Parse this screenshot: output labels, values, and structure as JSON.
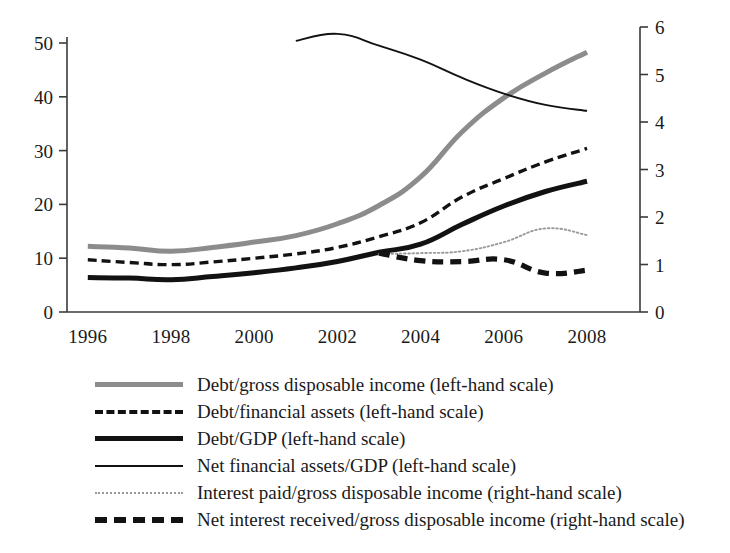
{
  "chart_data": {
    "type": "line",
    "title": "",
    "subtitle": "",
    "xlabel": "",
    "ylabel": "",
    "y2label": "",
    "grid": false,
    "legend_position": "below",
    "x": [
      1996,
      1997,
      1998,
      1999,
      2000,
      2001,
      2002,
      2003,
      2004,
      2005,
      2006,
      2007,
      2008
    ],
    "xlim": [
      1995.5,
      2008.6
    ],
    "xticks": [
      1996,
      1998,
      2000,
      2002,
      2004,
      2006,
      2008
    ],
    "xtick_labels": [
      "1996",
      "1998",
      "2000",
      "2002",
      "2004",
      "2006",
      "2008"
    ],
    "ylim": [
      0,
      53
    ],
    "yticks": [
      0,
      10,
      20,
      30,
      40,
      50
    ],
    "ytick_labels": [
      "0",
      "10",
      "20",
      "30",
      "40",
      "50"
    ],
    "y2lim": [
      0,
      6
    ],
    "y2ticks": [
      0,
      1,
      2,
      3,
      4,
      5,
      6
    ],
    "y2tick_labels": [
      "0",
      "1",
      "2",
      "3",
      "4",
      "5",
      "6"
    ],
    "series": [
      {
        "name": "Debt/gross disposable income (left-hand scale)",
        "axis": "left",
        "style": "thick-grey",
        "color": "#8c8c8c",
        "x": [
          1996,
          1997,
          1998,
          1999,
          2000,
          2001,
          2002,
          2003,
          2004,
          2005,
          2006,
          2007,
          2008
        ],
        "values": [
          12.2,
          11.9,
          11.3,
          12.0,
          13.0,
          14.2,
          16.4,
          19.8,
          25.1,
          33.5,
          39.8,
          44.4,
          48.3
        ]
      },
      {
        "name": "Debt/financial assets (left-hand scale)",
        "axis": "left",
        "style": "dash-medium",
        "color": "#121212",
        "x": [
          1996,
          1997,
          1998,
          1999,
          2000,
          2001,
          2002,
          2003,
          2004,
          2005,
          2006,
          2007,
          2008
        ],
        "values": [
          9.7,
          9.2,
          8.8,
          9.3,
          10.0,
          10.8,
          12.0,
          14.0,
          16.6,
          21.4,
          24.8,
          27.9,
          30.4
        ]
      },
      {
        "name": "Debt/GDP (left-hand scale)",
        "axis": "left",
        "style": "thick-black",
        "color": "#121212",
        "x": [
          1996,
          1997,
          1998,
          1999,
          2000,
          2001,
          2002,
          2003,
          2004,
          2005,
          2006,
          2007,
          2008
        ],
        "values": [
          6.4,
          6.3,
          6.0,
          6.6,
          7.3,
          8.2,
          9.4,
          11.1,
          12.6,
          16.3,
          19.7,
          22.4,
          24.3
        ]
      },
      {
        "name": "Net financial assets/GDP (left-hand scale)",
        "axis": "left",
        "style": "thin-black",
        "color": "#121212",
        "x": [
          2001,
          2002,
          2003,
          2004,
          2005,
          2006,
          2007,
          2008
        ],
        "values": [
          50.4,
          51.7,
          49.5,
          46.9,
          43.5,
          40.6,
          38.5,
          37.4
        ]
      },
      {
        "name": "Interest paid/gross disposable income (right-hand scale)",
        "axis": "right",
        "style": "dotted",
        "color": "#9a9a9a",
        "x": [
          2003,
          2004,
          2005,
          2006,
          2007,
          2008
        ],
        "values": [
          1.22,
          1.24,
          1.28,
          1.47,
          1.76,
          1.62
        ]
      },
      {
        "name": "Net interest received/gross disposable income (right-hand scale)",
        "axis": "right",
        "style": "dash-heavy",
        "color": "#121212",
        "x": [
          2003,
          2004,
          2005,
          2006,
          2007,
          2008
        ],
        "values": [
          1.24,
          1.08,
          1.06,
          1.1,
          0.82,
          0.88
        ]
      }
    ]
  },
  "axes": {
    "left_ticks": [
      "0",
      "10",
      "20",
      "30",
      "40",
      "50"
    ],
    "right_ticks": [
      "0",
      "1",
      "2",
      "3",
      "4",
      "5",
      "6"
    ],
    "x_ticks": [
      "1996",
      "1998",
      "2000",
      "2002",
      "2004",
      "2006",
      "2008"
    ]
  },
  "legend": {
    "items": [
      {
        "label": "Debt/gross disposable income (left-hand scale)",
        "style": "sw-thick-grey",
        "swatch_name": "legend-swatch-debt-gross-disposable-income"
      },
      {
        "label": "Debt/financial assets (left-hand scale)",
        "style": "sw-dash-med",
        "swatch_name": "legend-swatch-debt-financial-assets"
      },
      {
        "label": "Debt/GDP (left-hand scale)",
        "style": "sw-thick-black",
        "swatch_name": "legend-swatch-debt-gdp"
      },
      {
        "label": "Net financial assets/GDP (left-hand scale)",
        "style": "sw-thin-black",
        "swatch_name": "legend-swatch-net-financial-assets-gdp"
      },
      {
        "label": "Interest paid/gross disposable income (right-hand scale)",
        "style": "sw-dotted",
        "swatch_name": "legend-swatch-interest-paid"
      },
      {
        "label": "Net interest received/gross disposable income (right-hand scale)",
        "style": "sw-dash-heavy",
        "swatch_name": "legend-swatch-net-interest-received"
      }
    ]
  }
}
